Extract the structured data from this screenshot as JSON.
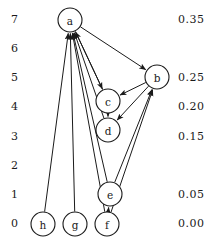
{
  "figure": {
    "type": "directed-graph",
    "width": 222,
    "height": 244,
    "background": "#ffffff",
    "ink_color": "#1a1a1a"
  },
  "axis_left": {
    "name": "rank-axis",
    "ticks": [
      {
        "label": "7",
        "x": 18,
        "y": 20
      },
      {
        "label": "6",
        "x": 18,
        "y": 49
      },
      {
        "label": "5",
        "x": 18,
        "y": 78
      },
      {
        "label": "4",
        "x": 18,
        "y": 107
      },
      {
        "label": "3",
        "x": 18,
        "y": 137
      },
      {
        "label": "2",
        "x": 18,
        "y": 166
      },
      {
        "label": "1",
        "x": 18,
        "y": 195
      },
      {
        "label": "0",
        "x": 18,
        "y": 224
      }
    ]
  },
  "axis_right": {
    "name": "value-axis",
    "ticks": [
      {
        "label": "0.35",
        "x": 178,
        "y": 20
      },
      {
        "label": "0.25",
        "x": 178,
        "y": 78
      },
      {
        "label": "0.20",
        "x": 178,
        "y": 107
      },
      {
        "label": "0.15",
        "x": 178,
        "y": 137
      },
      {
        "label": "0.05",
        "x": 178,
        "y": 195
      },
      {
        "label": "0.00",
        "x": 178,
        "y": 224
      }
    ]
  },
  "nodes": [
    {
      "id": "a",
      "label": "a",
      "cx": 70,
      "cy": 20,
      "r": 12
    },
    {
      "id": "b",
      "label": "b",
      "cx": 157,
      "cy": 77,
      "r": 12
    },
    {
      "id": "c",
      "label": "c",
      "cx": 108,
      "cy": 101,
      "r": 12
    },
    {
      "id": "d",
      "label": "d",
      "cx": 108,
      "cy": 130,
      "r": 12
    },
    {
      "id": "e",
      "label": "e",
      "cx": 110,
      "cy": 194,
      "r": 12
    },
    {
      "id": "f",
      "label": "f",
      "cx": 107,
      "cy": 224,
      "r": 12
    },
    {
      "id": "g",
      "label": "g",
      "cx": 75,
      "cy": 224,
      "r": 12
    },
    {
      "id": "h",
      "label": "h",
      "cx": 43,
      "cy": 224,
      "r": 12
    }
  ],
  "edges": [
    {
      "from": "a",
      "to": "b"
    },
    {
      "from": "a",
      "to": "c"
    },
    {
      "from": "b",
      "to": "c"
    },
    {
      "from": "b",
      "to": "d"
    },
    {
      "from": "c",
      "to": "d"
    },
    {
      "from": "c",
      "to": "a"
    },
    {
      "from": "d",
      "to": "a"
    },
    {
      "from": "e",
      "to": "a"
    },
    {
      "from": "e",
      "to": "b"
    },
    {
      "from": "f",
      "to": "a"
    },
    {
      "from": "f",
      "to": "b"
    },
    {
      "from": "f",
      "to": "e"
    },
    {
      "from": "g",
      "to": "a"
    },
    {
      "from": "h",
      "to": "a"
    }
  ]
}
